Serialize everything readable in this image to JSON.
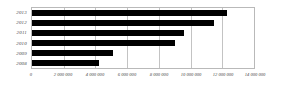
{
  "chart_data": {
    "type": "bar",
    "orientation": "horizontal",
    "title": "",
    "subtitle": "",
    "xlabel": "",
    "ylabel": "",
    "categories": [
      "2013",
      "2012",
      "2011",
      "2010",
      "2009",
      "2008"
    ],
    "values": [
      12300000,
      11500000,
      9600000,
      9000000,
      5100000,
      4200000
    ],
    "series": [
      {
        "name": "",
        "values": [
          12300000,
          11500000,
          9600000,
          9000000,
          5100000,
          4200000
        ]
      }
    ],
    "xlim": [
      0,
      14000000
    ],
    "ylim": null,
    "x_ticks": [
      0,
      2000000,
      4000000,
      6000000,
      8000000,
      10000000,
      12000000,
      14000000
    ],
    "x_tick_labels": [
      "0",
      "2 000 000",
      "4 000 000",
      "6 000 000",
      "8 000 000",
      "10 000 000",
      "12 000 000",
      "14 000 000"
    ],
    "grid": true,
    "grid_axis": "x",
    "legend": false,
    "legend_position": "none",
    "annotations": [],
    "colors": {
      "bar": "#000000",
      "grid": "#c3c3c3",
      "frame": "#b9b9b9",
      "tick_text": "#4a4a4a",
      "background": "#ffffff"
    }
  }
}
